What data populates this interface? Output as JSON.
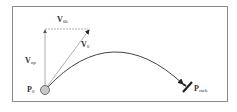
{
  "diagram": {
    "labels": {
      "v_horizontal": {
        "main": "V",
        "sub": "0h"
      },
      "v_up": {
        "main": "V",
        "sub": "up"
      },
      "v_initial": {
        "main": "V",
        "sub": "0"
      },
      "p_start": {
        "main": "P",
        "sub": "0"
      },
      "p_racket": {
        "main": "P",
        "sub": "rack"
      }
    },
    "colors": {
      "frame": "#8a8a8a",
      "guide_arrows": "#9a9a9a",
      "trajectory": "#444444",
      "ball_fill": "#c8c8c8",
      "racket": "#222222"
    }
  }
}
